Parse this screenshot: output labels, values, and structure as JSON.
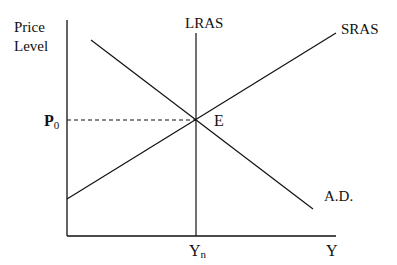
{
  "diagram": {
    "type": "AD-AS economic model",
    "axes": {
      "y_label_line1": "Price",
      "y_label_line2": "Level",
      "x_label": "Y"
    },
    "curves": {
      "lras_label": "LRAS",
      "sras_label": "SRAS",
      "ad_label": "A.D."
    },
    "equilibrium": {
      "point_label": "E",
      "price_label": "P",
      "price_subscript": "0",
      "output_label": "Y",
      "output_subscript": "n"
    },
    "colors": {
      "line": "#111111",
      "background": "#ffffff"
    }
  }
}
